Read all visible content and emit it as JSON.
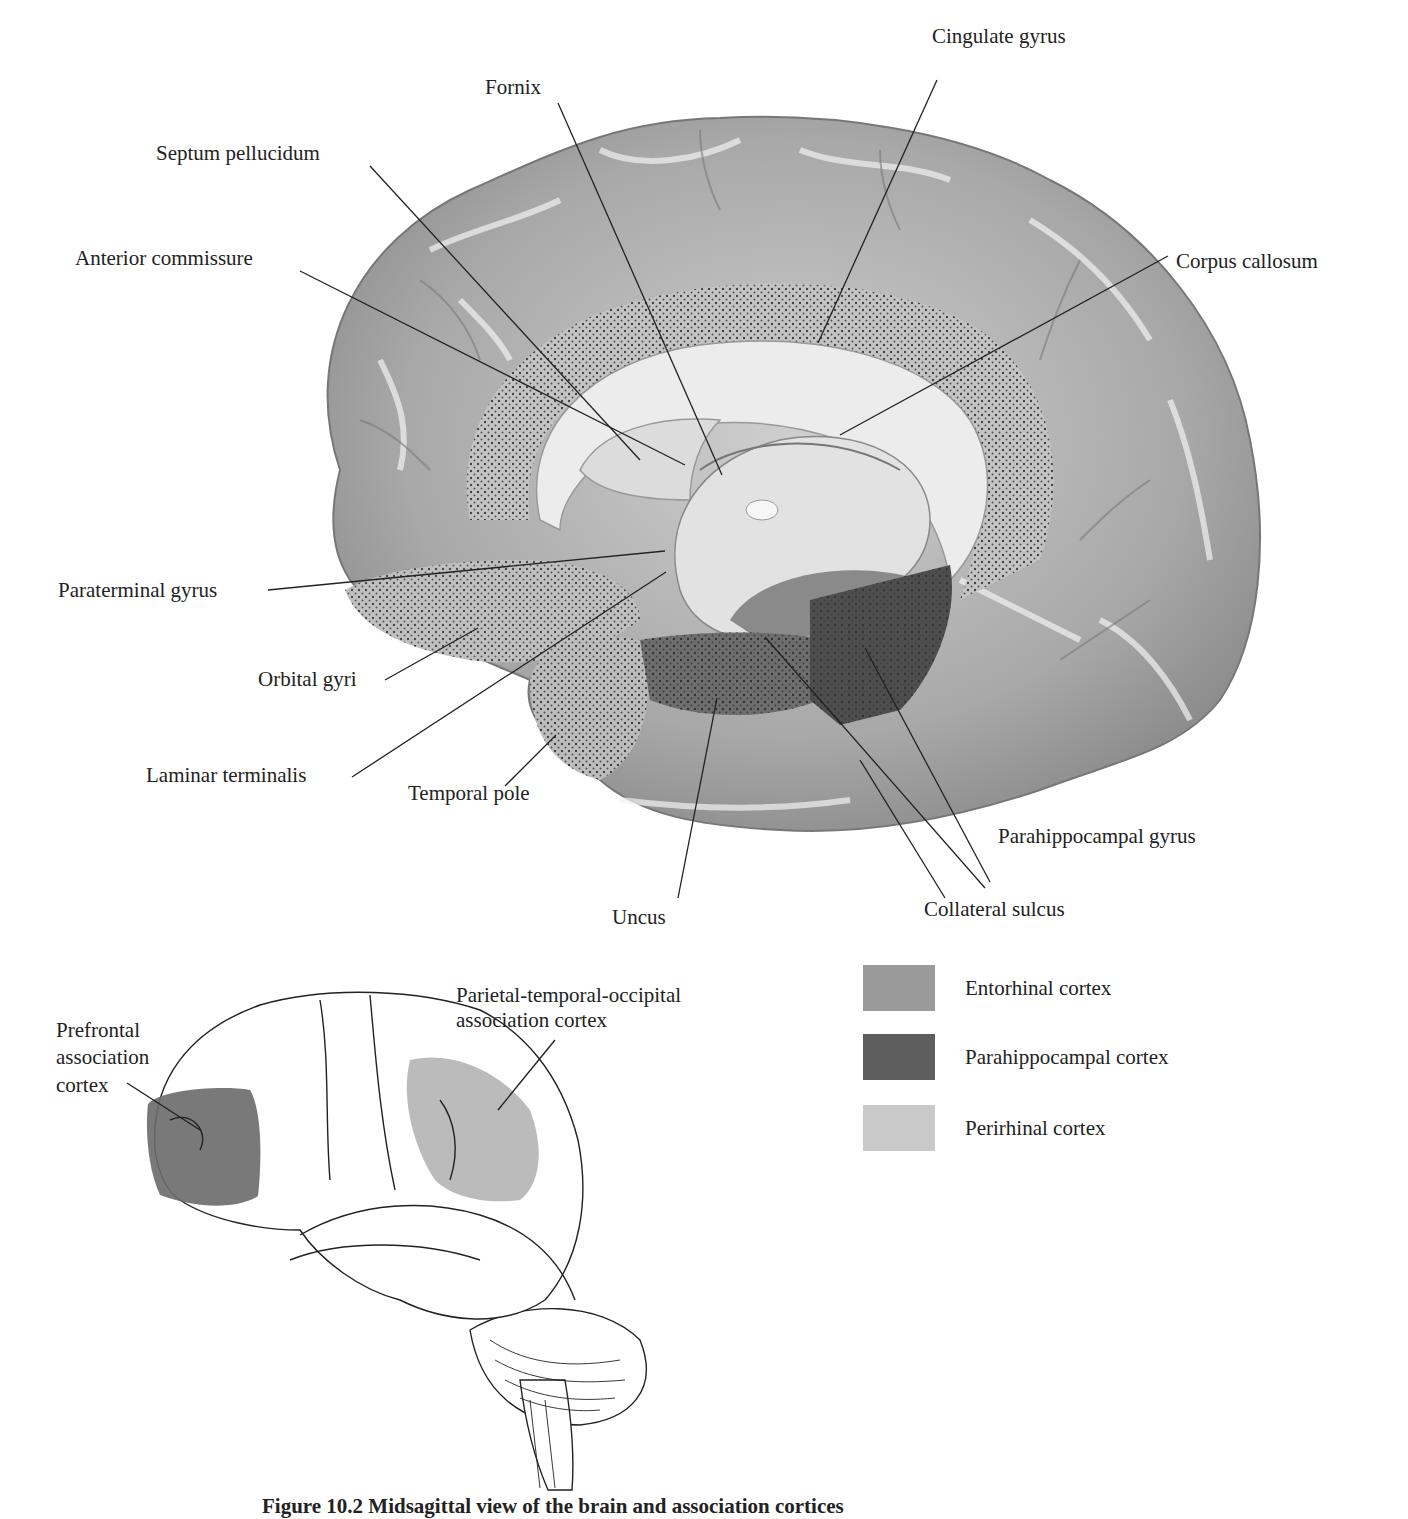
{
  "figure": {
    "medial_view": {
      "title": "Medial view of brain",
      "labels": {
        "fornix": "Fornix",
        "cingulate_gyrus": "Cingulate gyrus",
        "septum_pellucidum": "Septum pellucidum",
        "anterior_commissure": "Anterior commissure",
        "corpus_callosum": "Corpus callosum",
        "paraterminal_gyrus": "Paraterminal gyrus",
        "orbital_gyri": "Orbital gyri",
        "laminar_terminalis": "Laminar terminalis",
        "temporal_pole": "Temporal pole",
        "parahippocampal_gyrus": "Parahippocampal gyrus",
        "collateral_sulcus": "Collateral sulcus",
        "uncus": "Uncus"
      }
    },
    "legend": [
      {
        "label": "Entorhinal cortex",
        "color": "#9a9a9a"
      },
      {
        "label": "Parahippocampal cortex",
        "color": "#5e5e5e"
      },
      {
        "label": "Perirhinal cortex",
        "color": "#c9c9c9"
      }
    ],
    "lateral_view": {
      "labels": {
        "prefrontal_line1": "Prefrontal",
        "prefrontal_line2": "association",
        "prefrontal_line3": "cortex",
        "ptoc_line1": "Parietal-temporal-occipital",
        "ptoc_line2": "association cortex"
      },
      "colors": {
        "prefrontal": "#6a6a6a",
        "ptoc": "#b4b4b4"
      }
    },
    "caption": "Figure 10.2  Midsagittal view of the brain and association cortices"
  }
}
